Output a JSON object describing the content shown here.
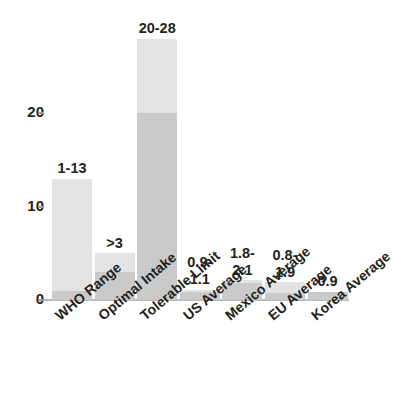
{
  "chart_data": {
    "type": "bar",
    "title": "",
    "subtitle": "",
    "xlabel": "",
    "ylabel": "",
    "ylim": [
      0,
      30
    ],
    "yticks": [
      0,
      10,
      20
    ],
    "ytick_labels": [
      "0",
      "10",
      "20"
    ],
    "grid": false,
    "legend": "none",
    "orientation": "vertical",
    "bar_style": "two-tone stacked range (lower segment = range minimum, upper segment = range maximum)",
    "colors": {
      "bar_upper": "#e3e3e3",
      "bar_lower": "#cacaca",
      "axis": "#b9b9b9",
      "text": "#231f20",
      "background": "#ffffff"
    },
    "categories": [
      "WHO Range",
      "Optimal Intake",
      "Tolerable Limit",
      "US Average",
      "Mexico Average",
      "EU Average",
      "Korea Average"
    ],
    "data_labels": [
      "1-13",
      ">3",
      "20-28",
      "0.9-\n1.1",
      "1.8-\n2.1",
      "0.8-\n1.9",
      "0.9"
    ],
    "series": [
      {
        "name": "Range minimum",
        "values": [
          1,
          3,
          20,
          0.9,
          1.8,
          0.8,
          0.9
        ]
      },
      {
        "name": "Range maximum",
        "values": [
          13,
          5,
          28,
          1.1,
          2.1,
          1.9,
          0.9
        ]
      }
    ],
    "bars": [
      {
        "category": "WHO Range",
        "label": "1-13",
        "min": 1,
        "max": 13,
        "label_lines": [
          "1-13"
        ]
      },
      {
        "category": "Optimal Intake",
        "label": ">3",
        "min": 3,
        "max": 5,
        "label_lines": [
          ">3"
        ]
      },
      {
        "category": "Tolerable Limit",
        "label": "20-28",
        "min": 20,
        "max": 28,
        "label_lines": [
          "20-28"
        ]
      },
      {
        "category": "US Average",
        "label": "0.9-1.1",
        "min": 0.9,
        "max": 1.1,
        "label_lines": [
          "0.9-",
          "1.1"
        ]
      },
      {
        "category": "Mexico Average",
        "label": "1.8-2.1",
        "min": 1.8,
        "max": 2.1,
        "label_lines": [
          "1.8-",
          "2.1"
        ]
      },
      {
        "category": "EU Average",
        "label": "0.8-1.9",
        "min": 0.8,
        "max": 1.9,
        "label_lines": [
          "0.8-",
          "1.9"
        ]
      },
      {
        "category": "Korea Average",
        "label": "0.9",
        "min": 0.9,
        "max": 0.9,
        "label_lines": [
          "0.9"
        ]
      }
    ]
  }
}
